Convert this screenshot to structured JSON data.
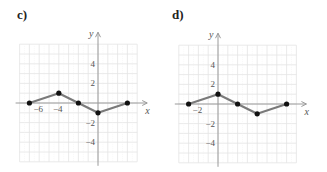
{
  "chart_data": [
    {
      "panel": "c)",
      "type": "line",
      "title": "",
      "xlabel": "x",
      "ylabel": "y",
      "x_tick_labels": [
        "-6",
        "-4"
      ],
      "y_tick_labels": [
        "4",
        "2",
        "-2",
        "-4"
      ],
      "xlim": [
        -8,
        4
      ],
      "ylim": [
        -6,
        6
      ],
      "grid": true,
      "points": [
        [
          -7,
          0
        ],
        [
          -4,
          1
        ],
        [
          -2,
          0
        ],
        [
          0,
          -1
        ],
        [
          3,
          0
        ]
      ]
    },
    {
      "panel": "d)",
      "type": "line",
      "title": "",
      "xlabel": "x",
      "ylabel": "y",
      "x_tick_labels": [
        "-2"
      ],
      "y_tick_labels": [
        "4",
        "2",
        "-2",
        "-4"
      ],
      "xlim": [
        -4,
        8
      ],
      "ylim": [
        -6,
        6
      ],
      "grid": true,
      "points": [
        [
          -3,
          0
        ],
        [
          0,
          1
        ],
        [
          2,
          0
        ],
        [
          4,
          -1
        ],
        [
          7,
          0
        ]
      ]
    }
  ],
  "panels": {
    "c": {
      "label": "c)"
    },
    "d": {
      "label": "d)"
    }
  },
  "colors": {
    "grid": "#e4e4e4",
    "axis": "#9a9a9a",
    "line": "#7a7a7a",
    "point": "#111111"
  }
}
